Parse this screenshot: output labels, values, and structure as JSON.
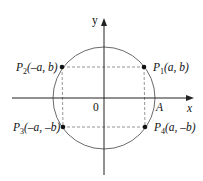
{
  "diagram": {
    "type": "unit-circle-symmetry",
    "axes": {
      "x_label": "x",
      "y_label": "y",
      "origin_label": "0"
    },
    "circle_point_label": "A",
    "points": [
      {
        "id": "P1",
        "name": "P",
        "sub": "1",
        "coords": "(a, b)"
      },
      {
        "id": "P2",
        "name": "P",
        "sub": "2",
        "coords": "(–a, b)"
      },
      {
        "id": "P3",
        "name": "P",
        "sub": "3",
        "coords": "(–a, –b)"
      },
      {
        "id": "P4",
        "name": "P",
        "sub": "4",
        "coords": "(a, –b)"
      }
    ],
    "colors": {
      "axis": "#222222",
      "circle": "#666666",
      "dashed": "#777777",
      "point": "#111111"
    }
  }
}
